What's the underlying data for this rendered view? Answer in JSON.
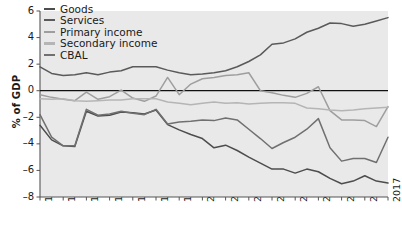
{
  "chart_data": {
    "type": "line",
    "title": "",
    "xlabel": "",
    "ylabel": "% of GDP",
    "ylim": [
      -8,
      6
    ],
    "yticks": [
      6,
      4,
      2,
      0,
      -2,
      -4,
      -6,
      -8
    ],
    "xticks": [
      "1987",
      "1989",
      "1991",
      "1993",
      "1995",
      "1997",
      "1999",
      "2001",
      "2003",
      "2005",
      "2007",
      "2009",
      "2011",
      "2013",
      "2015",
      "2017"
    ],
    "grid": false,
    "zero_line": true,
    "legend_position": "top-left",
    "x": [
      1987,
      1988,
      1989,
      1990,
      1991,
      1992,
      1993,
      1994,
      1995,
      1996,
      1997,
      1998,
      1999,
      2000,
      2001,
      2002,
      2003,
      2004,
      2005,
      2006,
      2007,
      2008,
      2009,
      2010,
      2011,
      2012,
      2013,
      2014,
      2015,
      2016,
      2017
    ],
    "series": [
      {
        "name": "Goods",
        "color": "#4d4d4d",
        "values": [
          -2.6,
          -3.7,
          -4.15,
          -4.2,
          -1.55,
          -1.9,
          -1.85,
          -1.6,
          -1.65,
          -1.75,
          -1.45,
          -2.55,
          -2.95,
          -3.3,
          -3.6,
          -4.3,
          -4.1,
          -4.5,
          -5.0,
          -5.45,
          -5.9,
          -5.9,
          -6.2,
          -5.9,
          -6.1,
          -6.6,
          -7.0,
          -6.8,
          -6.4,
          -6.8,
          -6.95
        ]
      },
      {
        "name": "Services",
        "color": "#5a5a5a",
        "values": [
          1.8,
          1.3,
          1.15,
          1.2,
          1.35,
          1.2,
          1.4,
          1.5,
          1.8,
          1.8,
          1.8,
          1.55,
          1.35,
          1.2,
          1.25,
          1.35,
          1.5,
          1.8,
          2.2,
          2.7,
          3.5,
          3.6,
          3.9,
          4.4,
          4.7,
          5.1,
          5.05,
          4.85,
          5.0,
          5.25,
          5.5
        ]
      },
      {
        "name": "Primary income",
        "color": "#9e9e9e",
        "values": [
          -0.3,
          -0.5,
          -0.65,
          -0.75,
          -0.1,
          -0.65,
          -0.45,
          0.05,
          -0.55,
          -0.8,
          -0.4,
          1.0,
          -0.3,
          0.5,
          0.9,
          1.0,
          1.15,
          1.2,
          1.35,
          0.0,
          -0.15,
          -0.35,
          -0.5,
          -0.2,
          0.3,
          -1.5,
          -2.2,
          -2.2,
          -2.25,
          -2.7,
          -1.2
        ]
      },
      {
        "name": "Secondary income",
        "color": "#b5b5b5",
        "values": [
          -0.6,
          -0.65,
          -0.6,
          -0.75,
          -0.8,
          -0.75,
          -0.7,
          -0.7,
          -0.6,
          -0.6,
          -0.6,
          -0.85,
          -0.95,
          -1.05,
          -0.95,
          -0.85,
          -0.95,
          -0.9,
          -1.0,
          -0.95,
          -0.9,
          -0.9,
          -0.95,
          -1.3,
          -1.35,
          -1.45,
          -1.5,
          -1.45,
          -1.35,
          -1.3,
          -1.25
        ]
      },
      {
        "name": "CBAL",
        "color": "#707070",
        "values": [
          -1.8,
          -3.5,
          -4.15,
          -4.15,
          -1.4,
          -1.85,
          -1.75,
          -1.55,
          -1.7,
          -1.8,
          -1.4,
          -2.5,
          -2.35,
          -2.3,
          -2.2,
          -2.25,
          -2.05,
          -2.2,
          -2.9,
          -3.6,
          -4.35,
          -3.9,
          -3.5,
          -2.9,
          -2.1,
          -4.3,
          -5.3,
          -5.1,
          -5.1,
          -5.4,
          -3.5
        ]
      }
    ]
  },
  "axes": {
    "ylabel": "% of GDP"
  },
  "legend": {
    "items": [
      {
        "label": "Goods"
      },
      {
        "label": "Services"
      },
      {
        "label": "Primary income"
      },
      {
        "label": "Secondary income"
      },
      {
        "label": "CBAL"
      }
    ]
  }
}
